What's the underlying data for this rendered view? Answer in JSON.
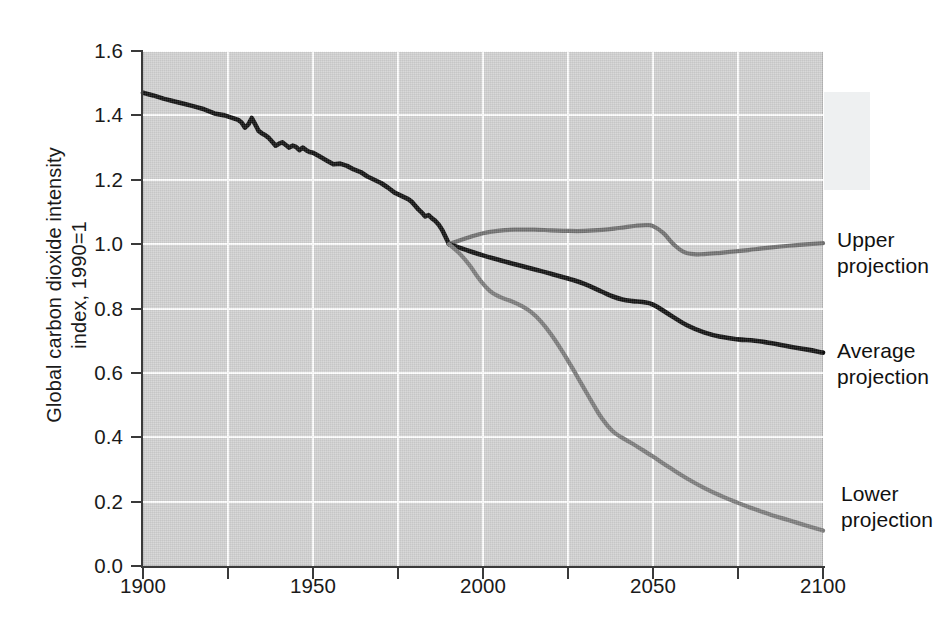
{
  "chart_data": {
    "type": "line",
    "title": "",
    "xlabel": "",
    "ylabel": "Global carbon dioxide intensity index, 1990=1",
    "ylabel_line1": "Global carbon dioxide intensity",
    "ylabel_line2": "index, 1990=1",
    "xlim": [
      1900,
      2100
    ],
    "ylim": [
      0.0,
      1.6
    ],
    "x_ticks": [
      1900,
      1925,
      1950,
      1975,
      2000,
      2025,
      2050,
      2075,
      2100
    ],
    "x_tick_labels": [
      "1900",
      "",
      "1950",
      "",
      "2000",
      "",
      "2050",
      "",
      "2100"
    ],
    "y_ticks": [
      0.0,
      0.2,
      0.4,
      0.6,
      0.8,
      1.0,
      1.2,
      1.4,
      1.6
    ],
    "y_tick_labels": [
      "0.0",
      "0.2",
      "0.4",
      "0.6",
      "0.8",
      "1.0",
      "1.2",
      "1.4",
      "1.6"
    ],
    "grid": true,
    "grid_color": "#ffffff",
    "plot_background": "#d2d2d2",
    "legend_position": "inline-annotations",
    "series": [
      {
        "name": "Historical",
        "color": "#111111",
        "width": 4.6,
        "x": [
          1900,
          1903,
          1906,
          1909,
          1912,
          1915,
          1918,
          1921,
          1924,
          1926,
          1928,
          1929,
          1930,
          1931,
          1932,
          1933,
          1934,
          1935,
          1936,
          1937,
          1938,
          1939,
          1940,
          1941,
          1942,
          1943,
          1944,
          1945,
          1946,
          1947,
          1948,
          1949,
          1950,
          1952,
          1954,
          1956,
          1958,
          1960,
          1962,
          1964,
          1966,
          1968,
          1970,
          1972,
          1974,
          1976,
          1978,
          1979,
          1980,
          1981,
          1982,
          1983,
          1984,
          1985,
          1986,
          1987,
          1988,
          1989,
          1990
        ],
        "y": [
          1.47,
          1.462,
          1.452,
          1.444,
          1.436,
          1.428,
          1.419,
          1.406,
          1.4,
          1.393,
          1.386,
          1.378,
          1.362,
          1.372,
          1.392,
          1.372,
          1.352,
          1.344,
          1.338,
          1.33,
          1.318,
          1.306,
          1.312,
          1.316,
          1.308,
          1.3,
          1.306,
          1.302,
          1.292,
          1.3,
          1.292,
          1.286,
          1.284,
          1.272,
          1.26,
          1.248,
          1.25,
          1.243,
          1.232,
          1.224,
          1.21,
          1.2,
          1.19,
          1.176,
          1.16,
          1.15,
          1.14,
          1.132,
          1.12,
          1.108,
          1.098,
          1.086,
          1.09,
          1.08,
          1.072,
          1.06,
          1.044,
          1.022,
          1.0
        ]
      },
      {
        "name": "Upper projection",
        "color": "#717171",
        "width": 4.2,
        "x": [
          1990,
          1995,
          2000,
          2005,
          2010,
          2015,
          2020,
          2025,
          2030,
          2035,
          2040,
          2045,
          2048,
          2050,
          2053,
          2056,
          2059,
          2062,
          2065,
          2070,
          2075,
          2080,
          2085,
          2090,
          2095,
          2100
        ],
        "y": [
          1.0,
          1.018,
          1.034,
          1.042,
          1.045,
          1.045,
          1.043,
          1.041,
          1.041,
          1.044,
          1.05,
          1.057,
          1.059,
          1.056,
          1.035,
          1.0,
          0.976,
          0.969,
          0.969,
          0.973,
          0.978,
          0.984,
          0.99,
          0.995,
          0.999,
          1.003
        ]
      },
      {
        "name": "Average projection",
        "color": "#111111",
        "width": 4.6,
        "x": [
          1990,
          1995,
          2000,
          2005,
          2010,
          2015,
          2020,
          2025,
          2030,
          2035,
          2038,
          2041,
          2044,
          2047,
          2050,
          2055,
          2060,
          2065,
          2070,
          2075,
          2080,
          2085,
          2090,
          2095,
          2100
        ],
        "y": [
          1.0,
          0.982,
          0.965,
          0.95,
          0.936,
          0.922,
          0.908,
          0.893,
          0.876,
          0.852,
          0.838,
          0.828,
          0.823,
          0.82,
          0.812,
          0.78,
          0.748,
          0.726,
          0.712,
          0.704,
          0.7,
          0.692,
          0.682,
          0.673,
          0.663
        ]
      },
      {
        "name": "Lower projection",
        "color": "#7c7c7c",
        "width": 4.2,
        "x": [
          1990,
          1993,
          1996,
          1999,
          2002,
          2005,
          2008,
          2011,
          2014,
          2017,
          2020,
          2023,
          2026,
          2029,
          2032,
          2035,
          2038,
          2041,
          2044,
          2047,
          2050,
          2055,
          2060,
          2065,
          2070,
          2075,
          2080,
          2085,
          2090,
          2095,
          2100
        ],
        "y": [
          1.0,
          0.972,
          0.935,
          0.89,
          0.855,
          0.836,
          0.824,
          0.81,
          0.79,
          0.76,
          0.72,
          0.672,
          0.62,
          0.565,
          0.51,
          0.458,
          0.42,
          0.398,
          0.38,
          0.36,
          0.34,
          0.305,
          0.272,
          0.243,
          0.218,
          0.196,
          0.176,
          0.158,
          0.142,
          0.126,
          0.11
        ]
      }
    ],
    "annotations": [
      {
        "id": "upper",
        "text": "Upper\nprojection"
      },
      {
        "id": "average",
        "text": "Average\nprojection"
      },
      {
        "id": "lower",
        "text": "Lower\nprojection"
      }
    ]
  }
}
